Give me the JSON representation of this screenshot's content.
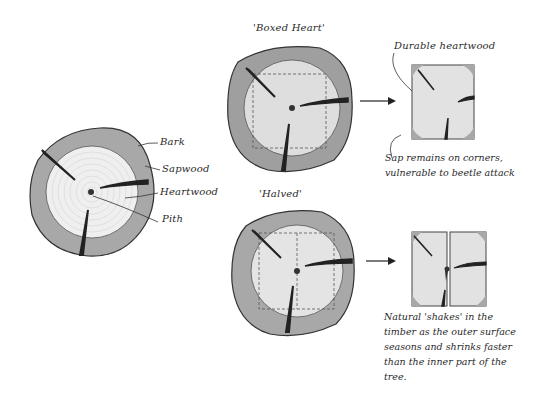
{
  "diagram": {
    "colors": {
      "bark": "#9a9a9a",
      "sapwood": "#bdbdbd",
      "heartwood": "#ebebeb",
      "heartwood_boxed": "#dcdcdc",
      "pith": "#333333",
      "ink": "#222222"
    },
    "main_log": {
      "labels": [
        "Bark",
        "Sapwood",
        "Heartwood",
        "Pith"
      ]
    },
    "boxed_heart": {
      "title": "'Boxed Heart'",
      "result_label": "Durable heartwood",
      "note": "Sap remains on corners,\nvulnerable to beetle attack"
    },
    "halved": {
      "title": "'Halved'",
      "note": "Natural 'shakes' in the\ntimber as the outer surface\nseasons and shrinks faster\nthan the inner part of the\ntree."
    }
  }
}
